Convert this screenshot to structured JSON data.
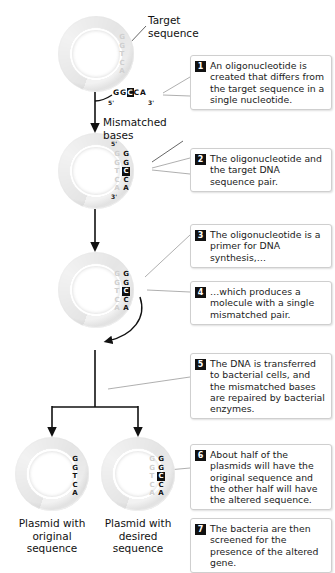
{
  "diagram": {
    "labels": {
      "target_sequence": "Target\nsequence",
      "target_sequence_line1": "Target",
      "target_sequence_line2": "sequence",
      "mismatched_bases_line1": "Mismatched",
      "mismatched_bases_line2": "bases",
      "plasmid_original_line1": "Plasmid with",
      "plasmid_original_line2": "original",
      "plasmid_original_line3": "sequence",
      "plasmid_desired_line1": "Plasmid with",
      "plasmid_desired_line2": "desired",
      "plasmid_desired_line3": "sequence"
    },
    "sequences": {
      "target_on_plasmid": "GGTCA",
      "oligo": "GGCCA",
      "oligo_prefix": "GG",
      "oligo_mutant_base": "C",
      "oligo_suffix": "CA",
      "original_plasmid": "GGTCA",
      "desired_plasmid_prefix": "GG",
      "desired_plasmid_mutant_base": "C",
      "desired_plasmid_suffix": "CA",
      "five_prime": "5'",
      "three_prime": "3'"
    },
    "steps": [
      {
        "number": "1",
        "text": "An oligonucleotide is created that differs from the target sequence in a single nucleotide."
      },
      {
        "number": "2",
        "text": "The oligonucleotide and the target DNA sequence pair."
      },
      {
        "number": "3",
        "text": "The oligonucleotide is a primer for DNA synthesis,…"
      },
      {
        "number": "4",
        "text": "…which produces a molecule with a single mismatched pair."
      },
      {
        "number": "5",
        "text": "The DNA is transferred to bacterial cells, and the mismatched bases are repaired by bacterial enzymes."
      },
      {
        "number": "6",
        "text": "About half of the plasmids will have the original sequence and the other half will have the altered sequence."
      },
      {
        "number": "7",
        "text": "The bacteria are then screened for the presence of the altered gene."
      }
    ],
    "colors": {
      "ink": "#111111",
      "ring_light": "#f0f0f0",
      "ring_mid": "#e2e2e2",
      "box_border": "#cfcfcf",
      "background": "#ffffff"
    }
  }
}
